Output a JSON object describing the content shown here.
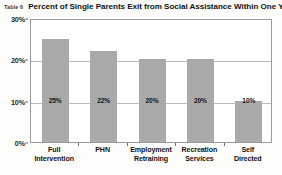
{
  "figure": {
    "caption_tag": "Table 6",
    "caption_title": "Percent of Single Parents Exit from Social Assistance Within One Year"
  },
  "colors": {
    "bar_fill": "#a9a9a9",
    "plot_border": "#9a9a9a",
    "gridline": "#b9b9b9",
    "text": "#111111",
    "background": "#fdfdfc"
  },
  "chart_data": {
    "type": "bar",
    "title": "Percent of Single Parents Exit from Social Assistance Within One Year",
    "xlabel": "",
    "ylabel": "",
    "categories": [
      "Full Intervention",
      "PHN",
      "Employment Retraining",
      "Recreation Services",
      "Self Directed"
    ],
    "category_lines": [
      [
        "Full",
        "Intervention"
      ],
      [
        "PHN"
      ],
      [
        "Employment",
        "Retraining"
      ],
      [
        "Recreation",
        "Services"
      ],
      [
        "Self",
        "Directed"
      ]
    ],
    "values": [
      25,
      22,
      20,
      20,
      10
    ],
    "value_labels": [
      "25%",
      "22%",
      "20%",
      "20%",
      "10%"
    ],
    "ylim": [
      0,
      30
    ],
    "yticks": [
      0,
      10,
      20,
      30
    ],
    "ytick_labels": [
      "0%",
      "10%",
      "20%",
      "30%"
    ],
    "grid": true,
    "legend": false
  }
}
